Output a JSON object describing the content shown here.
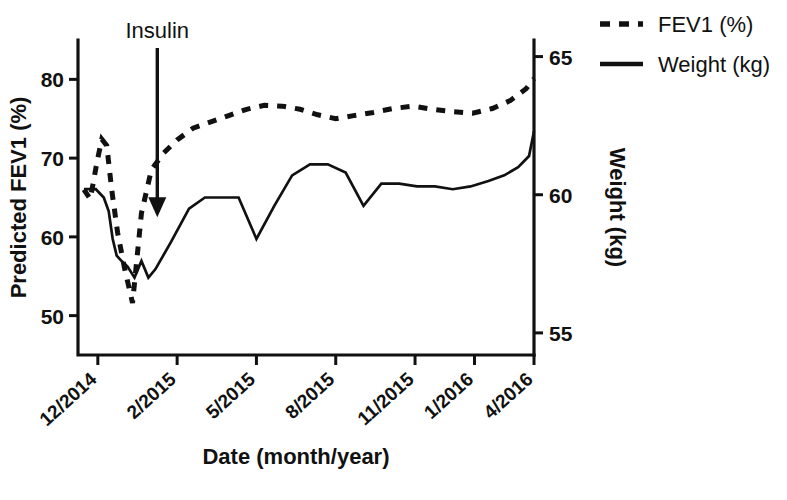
{
  "chart_data": {
    "type": "line",
    "title": "",
    "xlabel": "Date (month/year)",
    "ylabel": "Predicted FEV1 (%)",
    "y2label": "Weight (kg)",
    "grid": false,
    "legend_position": "top-right",
    "xlim": [
      0,
      23
    ],
    "x_tick_positions": [
      1,
      5,
      9,
      13,
      17,
      20,
      23
    ],
    "x_tick_labels": [
      "12/2014",
      "2/2015",
      "5/2015",
      "8/2015",
      "11/2015",
      "1/2016",
      "4/2016"
    ],
    "ylim": [
      45,
      85
    ],
    "y_tick_labels": [
      "50",
      "60",
      "70",
      "80"
    ],
    "y_tick_values": [
      50,
      60,
      70,
      80
    ],
    "y2lim": [
      54.2,
      65.6
    ],
    "y2_tick_labels": [
      "55",
      "60",
      "65"
    ],
    "y2_tick_values": [
      55,
      60,
      65
    ],
    "annotations": [
      {
        "label": "Insulin",
        "x": 4.0,
        "kind": "arrow-down",
        "y_top": 84.0,
        "y_tip": 63.0
      }
    ],
    "series": [
      {
        "name": "FEV1 (%)",
        "axis": "left",
        "style": "dashed",
        "units": "%",
        "x": [
          0.3,
          0.62,
          0.95,
          1.2,
          1.45,
          1.7,
          2.0,
          2.35,
          2.75,
          3.2,
          3.7,
          4.3,
          5.0,
          5.8,
          6.7,
          7.6,
          8.5,
          9.4,
          10.3,
          11.2,
          12.1,
          13.0,
          13.9,
          14.9,
          15.9,
          16.9,
          17.9,
          18.9,
          19.9,
          20.9,
          21.8,
          22.6,
          23.0
        ],
        "values": [
          66.0,
          64.8,
          69.4,
          72.4,
          71.6,
          66.0,
          60.5,
          56.0,
          51.6,
          63.0,
          68.5,
          70.6,
          72.3,
          73.8,
          74.6,
          75.4,
          76.2,
          76.7,
          76.6,
          76.2,
          75.5,
          75.0,
          75.4,
          75.8,
          76.3,
          76.6,
          76.2,
          75.9,
          75.7,
          76.3,
          77.3,
          78.8,
          80.1
        ]
      },
      {
        "name": "Weight (kg)",
        "axis": "right",
        "style": "solid",
        "units": "kg",
        "x": [
          0.3,
          0.9,
          1.3,
          1.55,
          1.75,
          1.95,
          2.2,
          2.5,
          2.85,
          3.2,
          3.55,
          3.9,
          4.7,
          5.6,
          6.4,
          7.2,
          8.1,
          9.0,
          9.9,
          10.8,
          11.7,
          12.6,
          13.5,
          14.4,
          15.3,
          16.2,
          17.1,
          18.0,
          18.9,
          19.8,
          20.7,
          21.5,
          22.2,
          22.75,
          23.0
        ],
        "values": [
          60.2,
          60.2,
          59.9,
          59.4,
          58.4,
          57.8,
          57.6,
          57.4,
          57.0,
          57.6,
          57.0,
          57.3,
          58.3,
          59.5,
          59.9,
          59.9,
          59.9,
          58.4,
          59.6,
          60.7,
          61.1,
          61.1,
          60.8,
          59.6,
          60.4,
          60.4,
          60.3,
          60.3,
          60.2,
          60.3,
          60.5,
          60.7,
          61.0,
          61.4,
          62.3
        ]
      }
    ]
  },
  "legend": {
    "items": [
      {
        "label": "FEV1 (%)",
        "style": "dashed"
      },
      {
        "label": "Weight (kg)",
        "style": "solid"
      }
    ]
  },
  "axes": {
    "left_title": "Predicted FEV1 (%)",
    "right_title": "Weight (kg)",
    "bottom_title": "Date (month/year)"
  },
  "annotation": {
    "insulin_label": "Insulin"
  }
}
